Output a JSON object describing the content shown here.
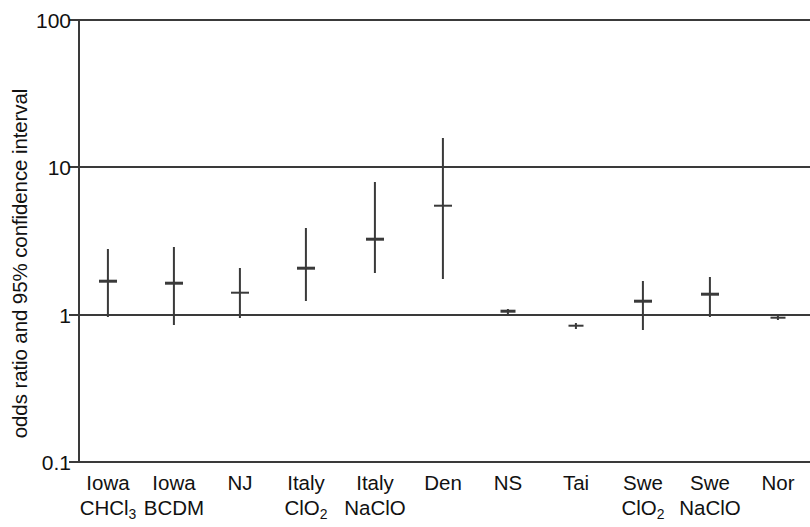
{
  "chart_data": {
    "type": "scatter",
    "title": "",
    "xlabel": "",
    "ylabel": "odds ratio and 95% confidence interval",
    "yscale": "log",
    "ylim": [
      0.1,
      100
    ],
    "ytick_labels": [
      "100",
      "10",
      "1",
      "0.1"
    ],
    "ytick_values": [
      100,
      10,
      1,
      0.1
    ],
    "grid": "horizontal gridlines at 100, 10, 1, 0.1",
    "legend": "none",
    "reference_line": 1,
    "categories": [
      "Iowa CHCl3",
      "Iowa BCDM",
      "NJ",
      "Italy ClO2",
      "Italy NaClO",
      "Den",
      "NS",
      "Tai",
      "Swe ClO2",
      "Swe NaClO",
      "Nor"
    ],
    "category_labels": [
      {
        "line1": "Iowa",
        "line2": "CHCl",
        "line2_sub": "3"
      },
      {
        "line1": "Iowa",
        "line2": "BCDM",
        "line2_sub": ""
      },
      {
        "line1": "NJ",
        "line2": "",
        "line2_sub": ""
      },
      {
        "line1": "Italy",
        "line2": "ClO",
        "line2_sub": "2"
      },
      {
        "line1": "Italy",
        "line2": "NaClO",
        "line2_sub": ""
      },
      {
        "line1": "Den",
        "line2": "",
        "line2_sub": ""
      },
      {
        "line1": "NS",
        "line2": "",
        "line2_sub": ""
      },
      {
        "line1": "Tai",
        "line2": "",
        "line2_sub": ""
      },
      {
        "line1": "Swe",
        "line2": "ClO",
        "line2_sub": "2"
      },
      {
        "line1": "Swe",
        "line2": "NaClO",
        "line2_sub": ""
      },
      {
        "line1": "Nor",
        "line2": "",
        "line2_sub": ""
      }
    ],
    "values": [
      1.69,
      1.64,
      1.41,
      2.07,
      3.24,
      5.5,
      1.05,
      0.84,
      1.23,
      1.37,
      0.95
    ],
    "ci_low": [
      0.97,
      0.85,
      0.95,
      1.23,
      1.92,
      1.75,
      1.0,
      0.8,
      0.79,
      0.97,
      0.92
    ],
    "ci_high": [
      2.77,
      2.86,
      2.06,
      3.9,
      8.0,
      15.9,
      1.1,
      0.88,
      1.69,
      1.8,
      0.98
    ],
    "x_positions": [
      108,
      174,
      240,
      306,
      375,
      443,
      508,
      576,
      643,
      710,
      778
    ]
  },
  "style": {
    "axis_color": "#3a3a3a",
    "text_color": "#111111",
    "background": "#ffffff"
  }
}
